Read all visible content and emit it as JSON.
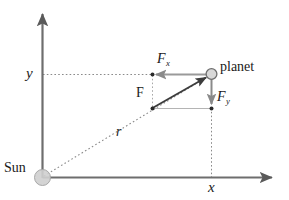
{
  "figure": {
    "type": "physics-vector-diagram",
    "background_color": "#ffffff"
  },
  "colors": {
    "axis": "#6e6e6e",
    "vector": "#3c3c3c",
    "component": "#9a9a9a",
    "dotted": "#8a8a8a",
    "sun_fill": "#cfcfcf",
    "sun_stroke": "#9a9a9a",
    "planet_fill": "#d6d6d6",
    "planet_stroke": "#6e6e6e",
    "text": "#1a1a1a"
  },
  "labels": {
    "y_axis": "y",
    "x_axis": "x",
    "sun": "Sun",
    "planet": "planet",
    "radius": "r",
    "force": "F",
    "force_x_base": "F",
    "force_x_sub": "x",
    "force_y_base": "F",
    "force_y_sub": "y"
  },
  "geometry": {
    "origin": {
      "x": 42,
      "y": 178
    },
    "y_axis_top": {
      "x": 42,
      "y": 10
    },
    "x_axis_right": {
      "x": 278,
      "y": 178
    },
    "planet_center": {
      "x": 211,
      "y": 74
    },
    "planet_radius": 5.5,
    "sun_radius": 8,
    "force_origin": {
      "x": 152,
      "y": 108
    },
    "force_x_point": {
      "x": 152,
      "y": 74
    },
    "force_y_point": {
      "x": 211,
      "y": 108
    }
  }
}
